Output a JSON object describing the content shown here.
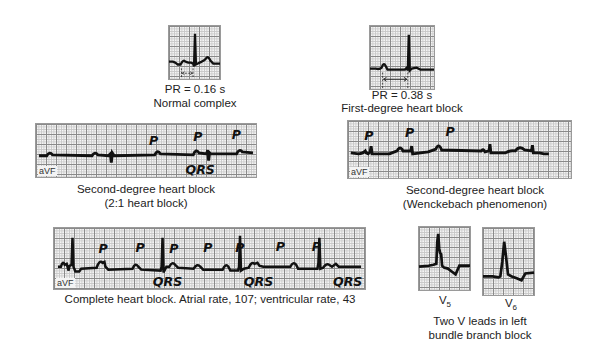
{
  "figures": {
    "normal": {
      "pr_label": "PR = 0.16 s",
      "title": "Normal complex"
    },
    "first_degree": {
      "pr_label": "PR = 0.38 s",
      "title": "First-degree heart block"
    },
    "second_degree_2to1": {
      "lead": "aVF",
      "title_line1": "Second-degree heart block",
      "title_line2": "(2:1 heart block)",
      "markers": [
        "P",
        "P",
        "P",
        "QRS"
      ]
    },
    "wenckebach": {
      "lead": "aVF",
      "title_line1": "Second-degree heart block",
      "title_line2": "(Wenckebach phenomenon)",
      "markers": [
        "P",
        "P",
        "P"
      ]
    },
    "complete": {
      "lead": "aVF",
      "title": "Complete heart block. Atrial rate, 107; ventricular rate, 43",
      "markers": [
        "P",
        "P",
        "P",
        "P",
        "P",
        "P",
        "P",
        "QRS",
        "QRS",
        "QRS"
      ]
    },
    "lbbb": {
      "lead_v5": "V",
      "lead_v5_sub": "5",
      "lead_v6": "V",
      "lead_v6_sub": "6",
      "title_line1": "Two V leads in left",
      "title_line2": "bundle branch block"
    }
  }
}
